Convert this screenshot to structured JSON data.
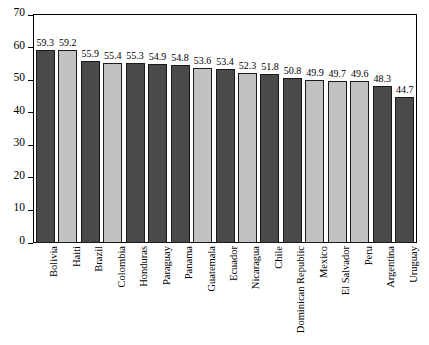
{
  "chart_data": {
    "type": "bar",
    "title": "",
    "subtitle": "",
    "xlabel": "",
    "ylabel": "",
    "ylim": [
      0,
      70
    ],
    "yticks": [
      0,
      10,
      20,
      30,
      40,
      50,
      60,
      70
    ],
    "grid": false,
    "legend": "none",
    "categories": [
      "Bolivia",
      "Haiti",
      "Brazil",
      "Colombia",
      "Honduras",
      "Paraguay",
      "Panama",
      "Guatemala",
      "Ecuador",
      "Nicaragua",
      "Chile",
      "Dominican Republic",
      "Mexico",
      "El Salvador",
      "Peru",
      "Argentina",
      "Uruguay"
    ],
    "values": [
      59.3,
      59.2,
      55.9,
      55.4,
      55.3,
      54.9,
      54.8,
      53.6,
      53.4,
      52.3,
      51.8,
      50.8,
      49.9,
      49.7,
      49.6,
      48.3,
      44.7
    ],
    "value_labels": [
      "59.3",
      "59.2",
      "55.9",
      "55.4",
      "55.3",
      "54.9",
      "54.8",
      "53.6",
      "53.4",
      "52.3",
      "51.8",
      "50.8",
      "49.9",
      "49.7",
      "49.6",
      "48.3",
      "44.7"
    ],
    "bar_shades": [
      "dark",
      "light",
      "dark",
      "light",
      "dark",
      "dark",
      "dark",
      "light",
      "dark",
      "light",
      "dark",
      "dark",
      "light",
      "light",
      "light",
      "dark",
      "dark"
    ],
    "colors": {
      "dark": "#4a4a4a",
      "light": "#c2c2c2",
      "bar_outline": "#1a1a1a",
      "axis": "#000000",
      "background": "#ffffff"
    }
  }
}
